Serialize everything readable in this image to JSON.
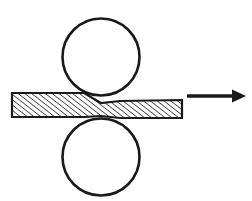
{
  "figure": {
    "canvas": {
      "width": 252,
      "height": 201,
      "background": "#ffffff"
    },
    "ink_color": "#1a1a1a",
    "hatch_color": "#2b2b2b",
    "fill_color": "#ffffff"
  },
  "rolls": [
    {
      "name": "upper-roll",
      "label": "Upper work roll",
      "cx": 101,
      "cy": 57,
      "r": 38.5,
      "stroke_width": 2.6
    },
    {
      "name": "lower-roll",
      "label": "Lower work roll",
      "cx": 101,
      "cy": 157,
      "r": 38.5,
      "stroke_width": 2.6
    }
  ],
  "workpiece": {
    "name": "strip",
    "label": "Metal strip",
    "entry_thickness": 24,
    "exit_thickness": 18,
    "neck_thickness": 13,
    "left_x": 12,
    "right_x": 182,
    "neck_x": 101,
    "top_profile": "M12,93 L84,93 L101,103 L120,101 L182,100",
    "bottom_profile": "M12,117 L84,117 L101,116 L120,118 L182,118",
    "stroke_width": 2.2,
    "hatch_angle_deg": 52,
    "hatch_spacing": 4.2,
    "hatch_line_width": 1.5
  },
  "arrow": {
    "name": "direction-arrow",
    "label": "Rolling direction",
    "x1": 187,
    "y1": 96,
    "x2": 246,
    "y2": 96,
    "shaft_width": 3.4,
    "head_length": 13,
    "head_half_width": 6.5
  }
}
